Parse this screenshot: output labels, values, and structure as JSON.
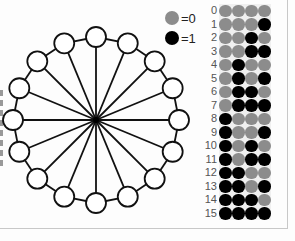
{
  "legend": {
    "items": [
      {
        "label": "=0",
        "color": "#8c8c8c",
        "value": 0
      },
      {
        "label": "=1",
        "color": "#000000",
        "value": 1
      }
    ]
  },
  "graph": {
    "type": "wheel",
    "hub": {
      "x": 96,
      "y": 120
    },
    "outer_node_count": 16,
    "radius": 83,
    "node_radius": 10
  },
  "table": {
    "row_labels": [
      "0",
      "1",
      "2",
      "3",
      "4",
      "5",
      "6",
      "7",
      "8",
      "9",
      "10",
      "11",
      "12",
      "13",
      "14",
      "15"
    ],
    "rows": [
      [
        0,
        0,
        0,
        0
      ],
      [
        0,
        0,
        0,
        1
      ],
      [
        0,
        0,
        1,
        0
      ],
      [
        0,
        0,
        1,
        1
      ],
      [
        0,
        1,
        0,
        0
      ],
      [
        0,
        1,
        0,
        1
      ],
      [
        0,
        1,
        1,
        0
      ],
      [
        0,
        1,
        1,
        1
      ],
      [
        1,
        0,
        0,
        0
      ],
      [
        1,
        0,
        0,
        1
      ],
      [
        1,
        0,
        1,
        0
      ],
      [
        1,
        0,
        1,
        1
      ],
      [
        1,
        1,
        0,
        0
      ],
      [
        1,
        1,
        0,
        1
      ],
      [
        1,
        1,
        1,
        0
      ],
      [
        1,
        1,
        1,
        1
      ]
    ]
  },
  "colors": {
    "zero": "#8c8c8c",
    "one": "#000000",
    "grid_bg": "#f0f0f0"
  }
}
